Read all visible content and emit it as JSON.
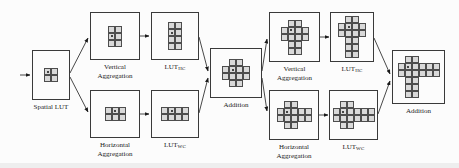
{
  "diagram": {
    "colors": {
      "box_border": "#3a3a3a",
      "cell_fill": "#d9d9d9",
      "cell_border": "#4d4d4d",
      "arrow": "#1a1a1a",
      "text": "#1a1a1a",
      "bg": "#fcfcfc"
    },
    "nodes": {
      "spatial": {
        "label": "Spatial LUT",
        "grid": [
          "oX",
          "XX"
        ]
      },
      "va1": {
        "label": "Vertical Aggregation",
        "grid": [
          "XX",
          "oX",
          "XX"
        ]
      },
      "luthc1": {
        "label_base": "LUT",
        "label_sub": "HC",
        "grid": [
          "XX",
          "oX",
          "XX",
          "XX"
        ]
      },
      "ha1": {
        "label": "Horizontal Aggregation",
        "grid": [
          "XoX",
          "XXX"
        ]
      },
      "lutwc1": {
        "label_base": "LUT",
        "label_sub": "WC",
        "grid": [
          "XoXX",
          "XXXX"
        ]
      },
      "add1": {
        "label": "Addition",
        "grid": [
          ".XX.",
          "XoXX",
          "XXXX",
          ".XX."
        ]
      },
      "va2": {
        "label": "Vertical Aggregation",
        "grid": [
          ".XX.",
          "XoXX",
          "XXXX",
          ".XX.",
          ".XX."
        ]
      },
      "luthc2": {
        "label_base": "LUT",
        "label_sub": "HC",
        "grid": [
          ".XX.",
          "XoXX",
          "XXXX",
          ".XX.",
          ".XX.",
          ".XX."
        ]
      },
      "ha2": {
        "label": "Horizontal Aggregation",
        "grid": [
          ".XX..",
          "XoXXX",
          "XXXXX",
          ".XX.."
        ]
      },
      "lutwc2": {
        "label_base": "LUT",
        "label_sub": "WC",
        "grid": [
          ".XX...",
          "XoXXXX",
          "XXXXXX",
          ".XX..."
        ]
      },
      "add2": {
        "label": "Addition",
        "grid": [
          ".XX...",
          "XoXXXX",
          "XXXXXX",
          ".XX...",
          ".XX...",
          ".XX..."
        ]
      }
    },
    "edges": [
      {
        "from": "input",
        "to": "spatial"
      },
      {
        "from": "spatial",
        "to": "va1"
      },
      {
        "from": "spatial",
        "to": "ha1"
      },
      {
        "from": "va1",
        "to": "luthc1"
      },
      {
        "from": "ha1",
        "to": "lutwc1"
      },
      {
        "from": "luthc1",
        "to": "add1"
      },
      {
        "from": "lutwc1",
        "to": "add1"
      },
      {
        "from": "add1",
        "to": "va2"
      },
      {
        "from": "add1",
        "to": "ha2"
      },
      {
        "from": "va2",
        "to": "luthc2"
      },
      {
        "from": "ha2",
        "to": "lutwc2"
      },
      {
        "from": "luthc2",
        "to": "add2"
      },
      {
        "from": "lutwc2",
        "to": "add2"
      }
    ]
  }
}
